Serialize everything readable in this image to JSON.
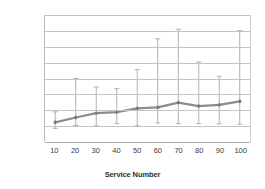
{
  "chart_data": {
    "type": "line",
    "title": "",
    "xlabel": "Service Number",
    "ylabel": "|ParallelSets|",
    "x": [
      10,
      20,
      30,
      40,
      50,
      60,
      70,
      80,
      90,
      100
    ],
    "categories": [
      "10",
      "20",
      "30",
      "40",
      "50",
      "60",
      "70",
      "80",
      "90",
      "100"
    ],
    "values": [
      6.2,
      7.7,
      9.1,
      9.4,
      10.6,
      10.9,
      12.4,
      11.3,
      11.7,
      12.8
    ],
    "error_upper": [
      9.5,
      20.0,
      17.3,
      16.8,
      22.8,
      32.5,
      35.5,
      25.2,
      20.7,
      35.1
    ],
    "error_lower": [
      4.3,
      5.2,
      5.1,
      5.8,
      5.1,
      6.0,
      5.8,
      5.8,
      5.7,
      5.6
    ],
    "series": [
      {
        "name": "|ParallelSets|",
        "values": [
          6.2,
          7.7,
          9.1,
          9.4,
          10.6,
          10.9,
          12.4,
          11.3,
          11.7,
          12.8
        ]
      }
    ],
    "xlim": [
      5,
      105
    ],
    "ylim": [
      0,
      40
    ],
    "ytick_labels": [
      "0,00",
      "5,00",
      "10,00",
      "15,00",
      "20,00",
      "25,00",
      "30,00",
      "35,00",
      "40,00"
    ],
    "ytick_values": [
      0,
      5,
      10,
      15,
      20,
      25,
      30,
      35,
      40
    ],
    "grid": "horizontal",
    "legend": "none",
    "line_color": "#8c8c8c",
    "marker_color": "#7a7a7a",
    "errorbar_color": "#a8a8a8",
    "gridline_color": "#c4c4c4",
    "decimal_separator": ","
  }
}
